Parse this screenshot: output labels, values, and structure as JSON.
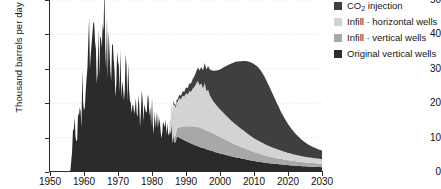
{
  "chart_data": {
    "type": "area",
    "stacked": true,
    "title": "",
    "xlabel": "",
    "ylabel": "Thousand barrels per day",
    "xlim": [
      1950,
      2030
    ],
    "ylim": [
      0,
      50
    ],
    "xticks": [
      1950,
      1960,
      1970,
      1980,
      1990,
      2000,
      2010,
      2020,
      2030
    ],
    "yticks": [
      0,
      10,
      20,
      30,
      40,
      50
    ],
    "grid": "horizontal-dotted",
    "legend_position": "right",
    "colors": {
      "co2_injection": "#3f3f3f",
      "infill_horizontal": "#d3d3d3",
      "infill_vertical": "#a8a8a8",
      "original_vertical": "#2b2b2b",
      "axis": "#2b2b2b",
      "gridline": "#d8d8d8",
      "background": "#ffffff"
    },
    "series": [
      {
        "name": "Original vertical wells",
        "key": "original_vertical",
        "color": "#2b2b2b",
        "x": [
          1950,
          1951,
          1952,
          1953,
          1954,
          1955,
          1956,
          1956.5,
          1957,
          1957.5,
          1958,
          1958.5,
          1959,
          1959.5,
          1960,
          1960.5,
          1961,
          1961.5,
          1962,
          1962.5,
          1963,
          1963.5,
          1964,
          1964.5,
          1965,
          1965.5,
          1966,
          1966.5,
          1967,
          1967.5,
          1968,
          1968.5,
          1969,
          1969.5,
          1970,
          1970.5,
          1971,
          1971.5,
          1972,
          1972.5,
          1973,
          1973.5,
          1974,
          1974.5,
          1975,
          1975.5,
          1976,
          1976.5,
          1977,
          1977.5,
          1978,
          1978.5,
          1979,
          1979.5,
          1980,
          1980.5,
          1981,
          1981.5,
          1982,
          1982.5,
          1983,
          1983.5,
          1984,
          1984.5,
          1985,
          1985.5,
          1986,
          1986.5,
          1987,
          1988,
          1989,
          1990,
          1991,
          1992,
          1993,
          1994,
          1995,
          1996,
          1997,
          1998,
          1999,
          2000,
          2002,
          2004,
          2006,
          2008,
          2010,
          2012,
          2014,
          2016,
          2018,
          2020,
          2022,
          2024,
          2026,
          2028,
          2030
        ],
        "y": [
          0,
          0,
          0,
          0,
          0,
          0,
          0.4,
          6.0,
          17.5,
          10.5,
          13.0,
          20.0,
          14.5,
          26.0,
          21.0,
          27.0,
          29.5,
          40.0,
          33.0,
          42.5,
          36.0,
          40.0,
          34.0,
          40.0,
          36.5,
          42.0,
          46.0,
          39.0,
          41.0,
          35.0,
          38.0,
          33.0,
          36.0,
          31.5,
          33.5,
          30.0,
          31.5,
          28.5,
          30.0,
          27.0,
          28.5,
          24.5,
          26.0,
          23.0,
          24.0,
          21.5,
          22.5,
          20.0,
          21.0,
          19.0,
          20.0,
          18.0,
          19.0,
          17.0,
          18.5,
          16.0,
          17.5,
          15.0,
          16.5,
          14.0,
          15.5,
          13.0,
          14.5,
          12.0,
          13.0,
          11.5,
          12.0,
          11.0,
          10.5,
          10.0,
          9.5,
          9.0,
          8.5,
          8.1,
          7.7,
          7.3,
          7.0,
          6.6,
          6.3,
          6.0,
          5.7,
          5.4,
          4.9,
          4.4,
          4.0,
          3.6,
          3.2,
          2.9,
          2.6,
          2.4,
          2.2,
          2.0,
          1.85,
          1.7,
          1.6,
          1.5,
          1.4
        ]
      },
      {
        "name": "Infill - vertical wells",
        "key": "infill_vertical",
        "color": "#a8a8a8",
        "x": [
          1950,
          1985,
          1986,
          1987,
          1988,
          1989,
          1990,
          1991,
          1992,
          1993,
          1994,
          1995,
          1996,
          1997,
          1998,
          1999,
          2000,
          2002,
          2004,
          2006,
          2008,
          2010,
          2012,
          2014,
          2016,
          2018,
          2020,
          2022,
          2024,
          2026,
          2028,
          2030
        ],
        "y": [
          0,
          0,
          1.0,
          2.0,
          3.0,
          3.7,
          4.3,
          4.8,
          5.2,
          5.5,
          5.6,
          5.6,
          5.5,
          5.4,
          5.2,
          5.0,
          4.8,
          4.3,
          3.8,
          3.4,
          3.0,
          2.6,
          2.3,
          2.0,
          1.8,
          1.6,
          1.45,
          1.3,
          1.2,
          1.1,
          1.05,
          1.0
        ]
      },
      {
        "name": "Infill - horizontal wells",
        "key": "infill_horizontal",
        "color": "#d3d3d3",
        "x": [
          1950,
          1985,
          1986,
          1986.5,
          1987,
          1987.5,
          1988,
          1988.5,
          1989,
          1989.5,
          1990,
          1990.5,
          1991,
          1991.5,
          1992,
          1992.5,
          1993,
          1993.5,
          1994,
          1994.5,
          1995,
          1995.5,
          1996,
          1996.5,
          1997,
          1997.5,
          1998,
          1998.5,
          1999,
          2000,
          2001,
          2002,
          2003,
          2004,
          2005,
          2006,
          2007,
          2008,
          2009,
          2010,
          2012,
          2014,
          2016,
          2018,
          2020,
          2022,
          2024,
          2026,
          2028,
          2030
        ],
        "y": [
          0,
          0,
          6.5,
          9.5,
          8.0,
          7.5,
          8.5,
          8.0,
          9.0,
          8.6,
          9.6,
          9.2,
          10.2,
          10.0,
          11.0,
          11.5,
          12.5,
          13.4,
          12.3,
          13.0,
          11.6,
          13.5,
          11.4,
          12.0,
          10.6,
          10.0,
          9.4,
          9.0,
          8.6,
          8.0,
          7.5,
          7.0,
          6.5,
          6.1,
          5.7,
          5.3,
          5.0,
          4.6,
          4.3,
          4.0,
          3.5,
          3.1,
          2.7,
          2.4,
          2.1,
          1.9,
          1.7,
          1.55,
          1.45,
          1.35
        ]
      },
      {
        "name": "CO2 injection",
        "key": "co2_injection",
        "color": "#3f3f3f",
        "x": [
          1950,
          1984,
          1985,
          1986,
          1987,
          1988,
          1989,
          1990,
          1991,
          1992,
          1993,
          1994,
          1995,
          1996,
          1997,
          1998,
          1999,
          2000,
          2001,
          2002,
          2003,
          2004,
          2005,
          2006,
          2007,
          2008,
          2009,
          2010,
          2011,
          2012,
          2013,
          2014,
          2015,
          2016,
          2017,
          2018,
          2019,
          2020,
          2021,
          2022,
          2023,
          2024,
          2025,
          2026,
          2027,
          2028,
          2029,
          2030
        ],
        "y": [
          0,
          0,
          0.15,
          0.35,
          0.6,
          0.9,
          1.3,
          1.7,
          2.2,
          2.8,
          3.5,
          4.3,
          5.3,
          6.3,
          7.5,
          8.8,
          10.2,
          11.6,
          13.2,
          14.7,
          16.2,
          17.5,
          18.6,
          19.5,
          20.3,
          21.0,
          21.4,
          21.6,
          21.4,
          20.8,
          19.7,
          18.2,
          16.5,
          14.7,
          12.9,
          11.2,
          9.7,
          8.4,
          7.3,
          6.3,
          5.5,
          4.8,
          4.2,
          3.7,
          3.3,
          3.0,
          2.7,
          2.5
        ]
      }
    ],
    "peaks": {
      "original_vertical_peak_value": 46,
      "original_vertical_peak_year": 1966,
      "infill_horizontal_stack_peak_value": 24,
      "infill_horizontal_stack_peak_year": 1996,
      "co2_stack_peak_value": 30.3,
      "co2_stack_peak_year": 2009
    }
  },
  "axes": {
    "ylabel": "Thousand barrels per day",
    "ytick_labels": [
      "50",
      "40",
      "30",
      "20",
      "10",
      "0"
    ],
    "xtick_labels": [
      "1950",
      "1960",
      "1970",
      "1980",
      "1990",
      "2000",
      "2010",
      "2020",
      "2030"
    ]
  },
  "legend": {
    "items": [
      {
        "label": "CO",
        "sub": "2",
        "label_tail": " injection",
        "swatch": "#3f3f3f",
        "name": "co2-injection"
      },
      {
        "label": "Infill · horizontal wells",
        "swatch": "#d3d3d3",
        "name": "infill-horizontal-wells"
      },
      {
        "label": "Infill · vertical wells",
        "swatch": "#a8a8a8",
        "name": "infill-vertical-wells"
      },
      {
        "label": "Original vertical wells",
        "swatch": "#2b2b2b",
        "name": "original-vertical-wells"
      }
    ]
  }
}
